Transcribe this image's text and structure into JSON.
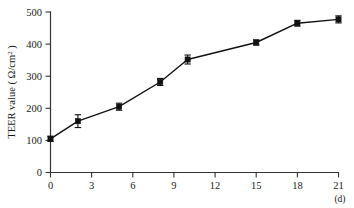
{
  "chart_data": {
    "type": "line",
    "title": "",
    "subtitle": "",
    "xlabel": "",
    "ylabel": "TEER value (Ω/cm²)",
    "ylabel_parts": {
      "text": "TEER value ( Ω/cm",
      "superscript": "2",
      "tail": " )"
    },
    "x_unit": "(d)",
    "xlim": [
      0,
      21
    ],
    "ylim": [
      0,
      500
    ],
    "grid": false,
    "legend": "none",
    "x_ticks": [
      "0",
      "3",
      "6",
      "9",
      "12",
      "15",
      "18",
      "21"
    ],
    "x_tick_values": [
      0,
      3,
      6,
      9,
      12,
      15,
      18,
      21
    ],
    "y_ticks": [
      "0",
      "100",
      "200",
      "300",
      "400",
      "500"
    ],
    "y_tick_values": [
      0,
      100,
      200,
      300,
      400,
      500
    ],
    "series": [
      {
        "name": "TEER value",
        "marker": "filled-square",
        "color": "#111111",
        "x": [
          0,
          2,
          5,
          8,
          10,
          15,
          18,
          21
        ],
        "values": [
          105,
          160,
          205,
          282,
          352,
          405,
          465,
          477
        ],
        "errors": [
          8,
          20,
          11,
          11,
          14,
          8,
          9,
          11
        ]
      }
    ]
  },
  "figure": {
    "accent_color": "#111111",
    "axis_color": "#333333",
    "background": "#ffffff"
  }
}
